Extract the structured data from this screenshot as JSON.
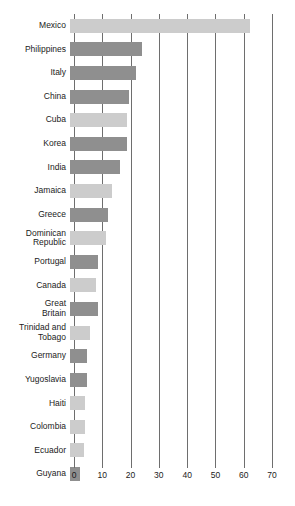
{
  "chart_data": {
    "type": "bar",
    "orientation": "horizontal",
    "title": "",
    "subtitle": "",
    "xlabel": "",
    "ylabel": "",
    "xlim": [
      0,
      70
    ],
    "xticks": [
      0,
      10,
      20,
      30,
      40,
      50,
      60,
      70
    ],
    "xtick_labels": [
      "0",
      "10",
      "20",
      "30",
      "40",
      "50",
      "60",
      "70"
    ],
    "grid": "vertical",
    "legend": "none",
    "categories": [
      "Mexico",
      "Philippines",
      "Italy",
      "China",
      "Cuba",
      "Korea",
      "India",
      "Jamaica",
      "Greece",
      "Dominican\nRepublic",
      "Portugal",
      "Canada",
      "Great\nBritain",
      "Trinidad and\nTobago",
      "Germany",
      "Yugoslavia",
      "Haiti",
      "Colombia",
      "Ecuador",
      "Guyana"
    ],
    "values": [
      63.6,
      25.4,
      23.3,
      21.0,
      20.0,
      20.0,
      17.7,
      15.0,
      13.4,
      12.7,
      10.0,
      9.3,
      10.0,
      7.0,
      6.0,
      6.0,
      5.3,
      5.3,
      5.0,
      3.5
    ],
    "bar_shades": [
      "light",
      "dark",
      "dark",
      "dark",
      "light",
      "dark",
      "dark",
      "light",
      "dark",
      "light",
      "dark",
      "light",
      "dark",
      "light",
      "dark",
      "dark",
      "light",
      "light",
      "light",
      "dark"
    ],
    "colors": {
      "bar_light": "#cccccc",
      "bar_dark": "#8f8f8f",
      "gridline": "#6e6e6e",
      "text": "#1b1b1b",
      "background": "#ffffff"
    }
  }
}
